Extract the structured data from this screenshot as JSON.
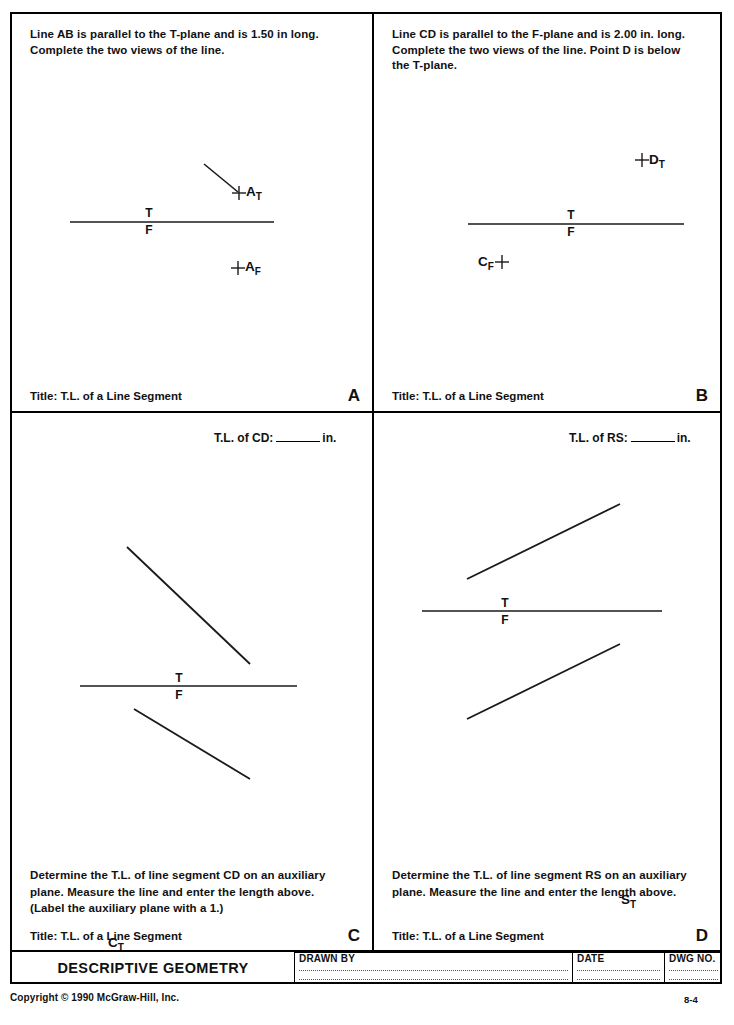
{
  "document": {
    "title": "DESCRIPTIVE GEOMETRY",
    "copyright": "Copyright © 1990 McGraw-Hill, Inc.",
    "page_number": "8-4"
  },
  "title_block": {
    "drawn_by_label": "DRAWN BY",
    "date_label": "DATE",
    "dwg_no_label": "DWG NO.",
    "drawn_by_value": "",
    "date_value": "",
    "dwg_no_value": ""
  },
  "panels": {
    "a": {
      "letter": "A",
      "prompt": "Line AB is parallel to the T-plane and is 1.50 in long.\nComplete the two views of the line.",
      "title": "Title: T.L. of a Line Segment",
      "fold_top_label": "T",
      "fold_bottom_label": "F",
      "points": [
        {
          "name": "A_T",
          "base": "A",
          "sub": "T"
        },
        {
          "name": "A_F",
          "base": "A",
          "sub": "F"
        }
      ]
    },
    "b": {
      "letter": "B",
      "prompt": "Line CD is parallel to the F-plane and is 2.00 in. long.\nComplete the two views of the line. Point D is below\nthe T-plane.",
      "title": "Title: T.L. of a Line Segment",
      "fold_top_label": "T",
      "fold_bottom_label": "F",
      "points": [
        {
          "name": "D_T",
          "base": "D",
          "sub": "T"
        },
        {
          "name": "C_F",
          "base": "C",
          "sub": "F"
        }
      ]
    },
    "c": {
      "letter": "C",
      "answer_prefix": "T.L. of CD:",
      "answer_suffix": "in.",
      "answer_value": "",
      "instruction": "Determine the T.L. of line segment CD on an auxiliary\nplane. Measure the line and enter the length above.\n(Label the auxiliary plane with a 1.)",
      "title": "Title: T.L. of a Line Segment",
      "fold_top_label": "T",
      "fold_bottom_label": "F",
      "points": [
        {
          "name": "C_T",
          "base": "C",
          "sub": "T"
        },
        {
          "name": "D_T",
          "base": "D",
          "sub": "T"
        },
        {
          "name": "C_F",
          "base": "C",
          "sub": "F"
        },
        {
          "name": "D_F",
          "base": "D",
          "sub": "F"
        }
      ]
    },
    "d": {
      "letter": "D",
      "answer_prefix": "T.L. of RS:",
      "answer_suffix": "in.",
      "answer_value": "",
      "instruction": "Determine the T.L. of line segment RS on an auxiliary\nplane. Measure the line and enter the length above.",
      "title": "Title: T.L. of a Line Segment",
      "fold_top_label": "T",
      "fold_bottom_label": "F",
      "points": [
        {
          "name": "R_T",
          "base": "R",
          "sub": "T"
        },
        {
          "name": "S_T",
          "base": "S",
          "sub": "T"
        },
        {
          "name": "R_F",
          "base": "R",
          "sub": "F"
        },
        {
          "name": "S_F",
          "base": "S",
          "sub": "F"
        }
      ]
    }
  },
  "colors": {
    "ink": "#111111",
    "line": "#1a1a1a",
    "paper": "#ffffff"
  }
}
